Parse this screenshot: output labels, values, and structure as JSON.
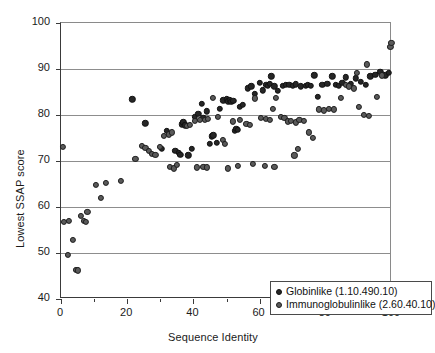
{
  "chart_data": {
    "type": "scatter",
    "title": "",
    "xlabel": "Sequence Identity",
    "ylabel": "Lowest SSAP score",
    "xlim": [
      0,
      100
    ],
    "ylim": [
      40,
      100
    ],
    "xticks": [
      0,
      20,
      40,
      60,
      80,
      100
    ],
    "xtick_labels": [
      "0",
      "20",
      "40",
      "60",
      "80",
      "100"
    ],
    "xminor_ticks": [
      10,
      30,
      50,
      70,
      90
    ],
    "yticks": [
      40,
      50,
      60,
      70,
      80,
      90,
      100
    ],
    "ytick_labels": [
      "40",
      "50",
      "60",
      "70",
      "80",
      "90",
      "100"
    ],
    "grid": "horizontal",
    "legend_position": "lower-right-inside",
    "series": [
      {
        "name": "Globinlike (1.10.490.10)",
        "marker": "filled-circle",
        "color": "#262626",
        "points": [
          [
            21.5,
            83.4
          ],
          [
            25.5,
            78.2
          ],
          [
            30.5,
            72.6
          ],
          [
            32.0,
            76.6
          ],
          [
            34.5,
            72.2
          ],
          [
            35.5,
            71.8
          ],
          [
            36.0,
            71.4
          ],
          [
            36.5,
            78.0
          ],
          [
            37.0,
            78.4
          ],
          [
            37.5,
            77.8
          ],
          [
            38.5,
            71.2
          ],
          [
            39.5,
            72.6
          ],
          [
            40.5,
            79.6
          ],
          [
            41.5,
            80.2
          ],
          [
            42.5,
            82.4
          ],
          [
            43.0,
            79.4
          ],
          [
            44.0,
            80.8
          ],
          [
            45.0,
            73.8
          ],
          [
            45.5,
            75.4
          ],
          [
            46.0,
            75.6
          ],
          [
            47.0,
            74.0
          ],
          [
            48.0,
            81.4
          ],
          [
            49.0,
            83.2
          ],
          [
            50.0,
            83.4
          ],
          [
            50.5,
            83.0
          ],
          [
            51.0,
            83.2
          ],
          [
            51.5,
            82.9
          ],
          [
            52.0,
            83.1
          ],
          [
            52.5,
            76.6
          ],
          [
            53.0,
            77.0
          ],
          [
            53.5,
            76.8
          ],
          [
            54.0,
            81.8
          ],
          [
            55.0,
            82.2
          ],
          [
            56.5,
            85.8
          ],
          [
            57.5,
            86.2
          ],
          [
            58.5,
            84.6
          ],
          [
            60.0,
            87.0
          ],
          [
            61.0,
            85.4
          ],
          [
            62.0,
            86.6
          ],
          [
            62.5,
            86.4
          ],
          [
            63.0,
            86.8
          ],
          [
            63.5,
            88.4
          ],
          [
            64.5,
            86.2
          ],
          [
            65.5,
            85.2
          ],
          [
            67.0,
            86.4
          ],
          [
            68.0,
            86.6
          ],
          [
            69.0,
            86.5
          ],
          [
            70.0,
            86.3
          ],
          [
            71.0,
            86.7
          ],
          [
            72.5,
            86.2
          ],
          [
            74.0,
            86.4
          ],
          [
            74.5,
            86.5
          ],
          [
            75.5,
            86.3
          ],
          [
            76.5,
            88.6
          ],
          [
            77.5,
            83.9
          ],
          [
            79.0,
            86.5
          ],
          [
            80.5,
            86.8
          ],
          [
            82.0,
            88.4
          ],
          [
            83.0,
            86.6
          ],
          [
            84.0,
            86.4
          ],
          [
            85.0,
            87.0
          ],
          [
            86.0,
            88.2
          ],
          [
            87.5,
            86.8
          ],
          [
            89.0,
            88.0
          ],
          [
            90.5,
            87.2
          ],
          [
            92.0,
            86.6
          ],
          [
            93.5,
            88.4
          ],
          [
            95.0,
            88.8
          ],
          [
            96.5,
            89.4
          ],
          [
            98.0,
            88.6
          ],
          [
            99.0,
            89.2
          ]
        ]
      },
      {
        "name": "Immunoglobulinlike (2.60.40.10)",
        "marker": "open-circle",
        "color": "#5a5a5a",
        "points": [
          [
            0.5,
            73.0
          ],
          [
            1.0,
            56.7
          ],
          [
            2.0,
            49.5
          ],
          [
            2.5,
            57.0
          ],
          [
            3.5,
            52.8
          ],
          [
            4.5,
            46.4
          ],
          [
            5.0,
            46.2
          ],
          [
            6.0,
            58.0
          ],
          [
            7.0,
            57.0
          ],
          [
            7.5,
            56.8
          ],
          [
            8.0,
            59.0
          ],
          [
            10.5,
            64.8
          ],
          [
            12.0,
            62.0
          ],
          [
            13.5,
            65.2
          ],
          [
            18.0,
            65.6
          ],
          [
            22.5,
            70.4
          ],
          [
            24.5,
            73.2
          ],
          [
            25.5,
            72.8
          ],
          [
            26.5,
            72.2
          ],
          [
            27.5,
            71.6
          ],
          [
            28.5,
            71.4
          ],
          [
            30.0,
            73.0
          ],
          [
            31.0,
            75.4
          ],
          [
            32.5,
            75.8
          ],
          [
            33.5,
            76.2
          ],
          [
            38.0,
            77.6
          ],
          [
            39.0,
            77.8
          ],
          [
            40.5,
            78.8
          ],
          [
            42.0,
            79.0
          ],
          [
            43.5,
            78.9
          ],
          [
            44.5,
            79.2
          ],
          [
            46.0,
            83.8
          ],
          [
            47.5,
            79.6
          ],
          [
            49.0,
            74.6
          ],
          [
            49.5,
            73.8
          ],
          [
            52.0,
            78.6
          ],
          [
            54.0,
            79.0
          ],
          [
            56.0,
            78.0
          ],
          [
            57.0,
            77.8
          ],
          [
            58.5,
            83.6
          ],
          [
            60.5,
            79.4
          ],
          [
            62.0,
            79.2
          ],
          [
            63.0,
            79.0
          ],
          [
            64.0,
            81.4
          ],
          [
            65.0,
            83.8
          ],
          [
            66.5,
            79.6
          ],
          [
            67.5,
            79.4
          ],
          [
            68.5,
            78.6
          ],
          [
            69.5,
            78.8
          ],
          [
            71.0,
            78.4
          ],
          [
            72.0,
            79.0
          ],
          [
            73.5,
            78.8
          ],
          [
            75.0,
            76.2
          ],
          [
            76.0,
            75.0
          ],
          [
            78.0,
            81.2
          ],
          [
            79.5,
            81.0
          ],
          [
            81.0,
            81.4
          ],
          [
            82.5,
            81.2
          ],
          [
            84.5,
            83.8
          ],
          [
            86.0,
            86.5
          ],
          [
            87.0,
            86.2
          ],
          [
            88.5,
            85.8
          ],
          [
            90.0,
            81.8
          ],
          [
            91.5,
            80.0
          ],
          [
            93.0,
            79.8
          ],
          [
            95.5,
            84.0
          ],
          [
            97.0,
            88.6
          ],
          [
            99.5,
            94.8
          ],
          [
            99.8,
            95.6
          ],
          [
            33.0,
            68.8
          ],
          [
            34.0,
            68.4
          ],
          [
            35.0,
            69.2
          ],
          [
            41.0,
            68.6
          ],
          [
            43.0,
            68.8
          ],
          [
            44.0,
            68.6
          ],
          [
            50.5,
            68.4
          ],
          [
            53.5,
            68.9
          ],
          [
            58.0,
            69.4
          ],
          [
            61.5,
            69.0
          ],
          [
            64.5,
            68.7
          ],
          [
            70.5,
            71.2
          ],
          [
            71.5,
            72.6
          ],
          [
            89.5,
            89.2
          ],
          [
            92.5,
            91.0
          ]
        ]
      }
    ]
  },
  "legend": {
    "entries": [
      {
        "label": "Globinlike (1.10.490.10)"
      },
      {
        "label": "Immunoglobulinlike (2.60.40.10)"
      }
    ]
  }
}
